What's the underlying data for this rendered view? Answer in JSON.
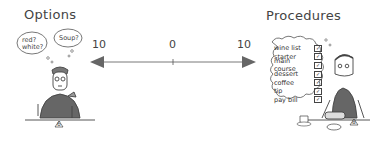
{
  "left_panel": {
    "title": "Options",
    "thought_bubbles": [
      "red? white?",
      "Soup?"
    ],
    "table_number": "6"
  },
  "scale": {
    "left_label": "10",
    "center_label": "0",
    "right_label": "10"
  },
  "right_panel": {
    "title": "Procedures",
    "checklist": [
      {
        "label": "wine list",
        "checked": true
      },
      {
        "label": "starter",
        "checked": true
      },
      {
        "label": "main course",
        "checked": true
      },
      {
        "label": "dessert",
        "checked": true
      },
      {
        "label": "coffee",
        "checked": true
      },
      {
        "label": "tip",
        "checked": true
      },
      {
        "label": "pay bill",
        "checked": true
      }
    ],
    "table_number": "8",
    "check_mark": "✓"
  }
}
